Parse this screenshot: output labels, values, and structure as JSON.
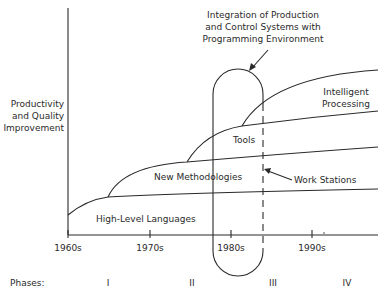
{
  "diagram": {
    "y_axis_label": [
      "Productivity",
      "and Quality",
      "Improvement"
    ],
    "x_ticks": [
      "1960s",
      "1970s",
      "1980s",
      "1990s"
    ],
    "phases_label": "Phases:",
    "phases": [
      "I",
      "II",
      "III",
      "IV"
    ],
    "regions": {
      "high_level_languages": "High-Level Languages",
      "new_methodologies": "New Methodologies",
      "tools": "Tools",
      "intelligent_processing": [
        "Intelligent",
        "Processing"
      ]
    },
    "annotations": {
      "integration": [
        "Integration of Production",
        "and Control Systems with",
        "Programming Environment"
      ],
      "work_stations": "Work Stations"
    },
    "colors": {
      "line": "#2a2a2a",
      "background": "#ffffff"
    }
  }
}
